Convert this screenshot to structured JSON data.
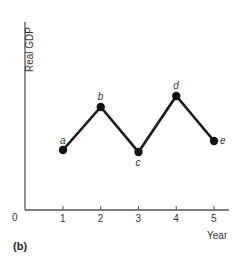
{
  "chart_data": {
    "type": "line",
    "title": "",
    "panel_label": "(b)",
    "xlabel": "Year",
    "ylabel": "Real GDP",
    "origin_label": "0",
    "x": [
      1,
      2,
      3,
      4,
      5
    ],
    "xticks": [
      "1",
      "2",
      "3",
      "4",
      "5"
    ],
    "series": [
      {
        "name": "Real GDP",
        "point_labels": [
          "a",
          "b",
          "c",
          "d",
          "e"
        ],
        "values": [
          60,
          103,
          58,
          114,
          69
        ]
      }
    ],
    "ylim": [
      0,
      188
    ],
    "xlim": [
      0,
      5.4
    ],
    "grid": false,
    "legend": "none",
    "y_ticks_shown": false
  },
  "colors": {
    "line": "#1a1a1a",
    "axis": "#555555",
    "marker": "#111111"
  }
}
